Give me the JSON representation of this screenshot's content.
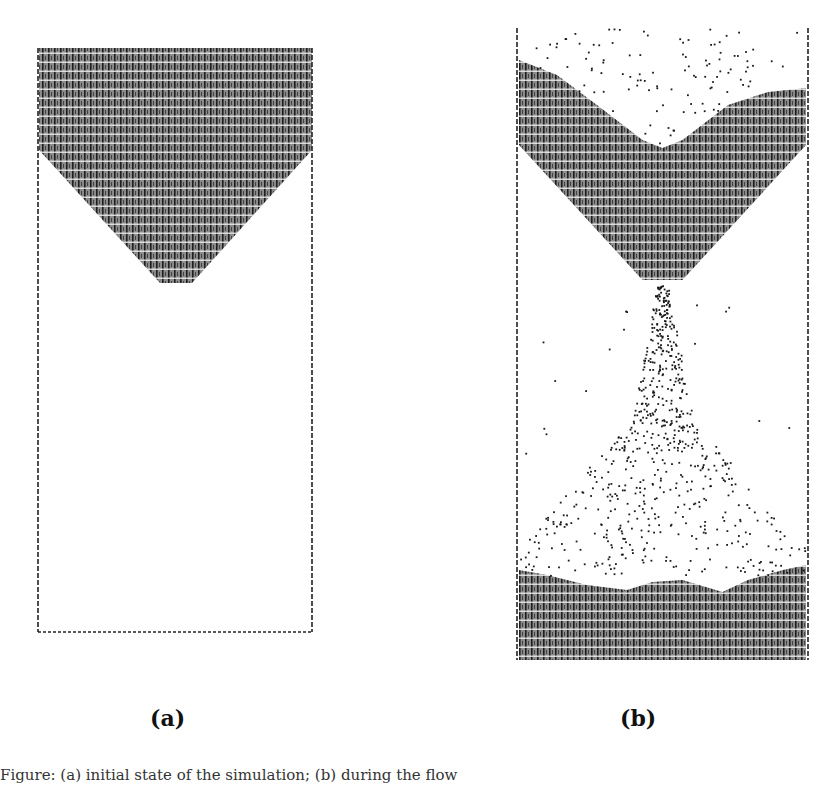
{
  "figure": {
    "panels": [
      {
        "id": "a",
        "label": "(a)",
        "description": "Initial state: granular material filling the upper reservoir of an hourglass-shaped container, V-shaped funnel above an empty lower chamber",
        "container": {
          "left": 38,
          "top": 48,
          "right": 312,
          "bottom": 632
        },
        "fill": {
          "top": 48,
          "funnel_start_y": 150,
          "neck_y": 283,
          "neck_left": 160,
          "neck_right": 192
        }
      },
      {
        "id": "b",
        "label": "(b)",
        "description": "Flowing state: grains draining through the neck, sparse particles in the upper and lower chambers, pile accumulating at bottom",
        "container": {
          "left": 517,
          "top": 28,
          "right": 808,
          "bottom": 660
        },
        "upper_pile": {
          "left_edge_y": 60,
          "center_dip_y": 150,
          "right_edge_y": 90
        },
        "funnel_neck_y": 285,
        "bottom_pile_surface_y": 575
      }
    ],
    "caption_fragment": "Figure: (a) initial state of the simulation; (b) during the flow"
  },
  "colors": {
    "grain": "#1a1a1a",
    "background": "#ffffff",
    "wall": "#222222"
  }
}
